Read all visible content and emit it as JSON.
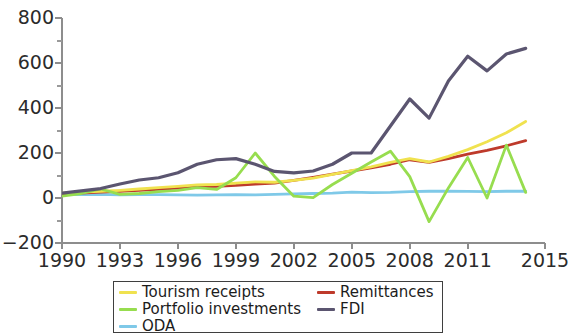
{
  "chart_data": {
    "type": "line",
    "title": "",
    "xlabel": "",
    "ylabel": "",
    "xlim": [
      1990,
      2015
    ],
    "ylim": [
      -200,
      800
    ],
    "y_ticks": [
      800,
      600,
      400,
      200,
      0,
      -200
    ],
    "y_tick_labels": [
      "800",
      "600",
      "400",
      "200",
      "0",
      "−200"
    ],
    "y_minor_ticks": [
      700,
      500,
      300,
      100,
      -100
    ],
    "x_ticks": [
      1990,
      1993,
      1996,
      1999,
      2002,
      2005,
      2008,
      2011,
      2015
    ],
    "x_tick_labels": [
      "1990",
      "1993",
      "1996",
      "1999",
      "2002",
      "2005",
      "2008",
      "2011",
      "2015"
    ],
    "x": [
      1990,
      1991,
      1992,
      1993,
      1994,
      1995,
      1996,
      1997,
      1998,
      1999,
      2000,
      2001,
      2002,
      2003,
      2004,
      2005,
      2006,
      2007,
      2008,
      2009,
      2010,
      2011,
      2012,
      2013,
      2014
    ],
    "grid": false,
    "legend_position": "below",
    "series": [
      {
        "name": "Tourism receipts",
        "color": "#F0E24F",
        "values": [
          22,
          26,
          30,
          34,
          40,
          46,
          52,
          58,
          60,
          66,
          72,
          70,
          78,
          88,
          105,
          122,
          138,
          158,
          175,
          160,
          185,
          215,
          250,
          290,
          340
        ]
      },
      {
        "name": "Portfolio investments",
        "color": "#97DD4F",
        "values": [
          8,
          20,
          40,
          16,
          20,
          28,
          34,
          46,
          38,
          90,
          200,
          96,
          8,
          2,
          60,
          110,
          160,
          208,
          95,
          -105,
          45,
          180,
          0,
          235,
          25
        ]
      },
      {
        "name": "ODA",
        "color": "#7FC9E8",
        "values": [
          15,
          15,
          16,
          14,
          15,
          15,
          14,
          13,
          14,
          15,
          14,
          16,
          18,
          20,
          22,
          26,
          24,
          25,
          28,
          30,
          30,
          29,
          28,
          30,
          30
        ]
      },
      {
        "name": "Remittances",
        "color": "#BE3A2B",
        "values": [
          18,
          22,
          26,
          30,
          34,
          38,
          44,
          50,
          52,
          56,
          62,
          66,
          78,
          92,
          106,
          120,
          134,
          150,
          170,
          158,
          175,
          195,
          212,
          232,
          255
        ]
      },
      {
        "name": "FDI",
        "color": "#5B5570",
        "values": [
          22,
          32,
          42,
          62,
          80,
          90,
          112,
          150,
          170,
          175,
          150,
          118,
          112,
          120,
          150,
          200,
          200,
          320,
          440,
          355,
          520,
          630,
          565,
          640,
          665
        ]
      }
    ]
  },
  "legend": {
    "items": [
      {
        "label": "Tourism receipts",
        "color": "#F0E24F"
      },
      {
        "label": "Portfolio investments",
        "color": "#97DD4F"
      },
      {
        "label": "ODA",
        "color": "#7FC9E8"
      },
      {
        "label": "Remittances",
        "color": "#BE3A2B"
      },
      {
        "label": "FDI",
        "color": "#5B5570"
      }
    ]
  }
}
